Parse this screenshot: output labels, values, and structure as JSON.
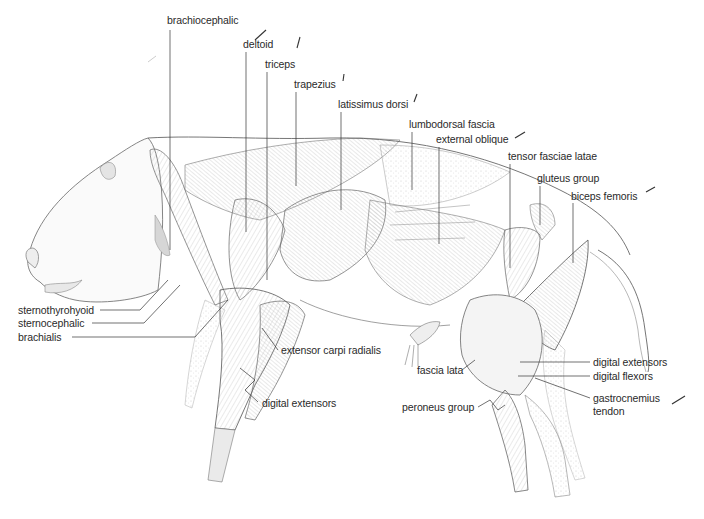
{
  "figure": {
    "colors": {
      "ink": "#2a2a2a",
      "shade": "#9a9a9a",
      "background": "#ffffff"
    }
  },
  "labels": {
    "top": [
      {
        "id": "brachiocephalic",
        "text": "brachiocephalic",
        "x": 167,
        "y": 14,
        "lx": 170,
        "ly1": 30,
        "ly2": 250
      },
      {
        "id": "deltoid",
        "text": "deltoid",
        "x": 243,
        "y": 38,
        "lx": 246,
        "ly1": 52,
        "ly2": 232
      },
      {
        "id": "triceps",
        "text": "triceps",
        "x": 265,
        "y": 58,
        "lx": 267,
        "ly1": 72,
        "ly2": 280
      },
      {
        "id": "trapezius",
        "text": "trapezius",
        "x": 294,
        "y": 78,
        "lx": 296,
        "ly1": 92,
        "ly2": 186
      },
      {
        "id": "latissimus-dorsi",
        "text": "latissimus dorsi",
        "x": 338,
        "y": 98,
        "lx": 341,
        "ly1": 112,
        "ly2": 210
      },
      {
        "id": "lumbodorsal-fascia",
        "text": "lumbodorsal fascia",
        "x": 409,
        "y": 118,
        "lx": 412,
        "ly1": 132,
        "ly2": 190
      },
      {
        "id": "external-oblique",
        "text": "external oblique",
        "x": 436,
        "y": 133,
        "lx": 439,
        "ly1": 147,
        "ly2": 244
      },
      {
        "id": "tensor-fasciae-latae",
        "text": "tensor fasciae latae",
        "x": 508,
        "y": 150,
        "lx": 510,
        "ly1": 164,
        "ly2": 268
      },
      {
        "id": "gluteus-group",
        "text": "gluteus group",
        "x": 537,
        "y": 172,
        "lx": 540,
        "ly1": 186,
        "ly2": 225
      },
      {
        "id": "biceps-femoris",
        "text": "biceps femoris",
        "x": 571,
        "y": 190,
        "lx": 573,
        "ly1": 203,
        "ly2": 263
      }
    ],
    "left": [
      {
        "id": "sternothyrohyoid",
        "text": "sternothyrohyoid",
        "x": 18,
        "y": 307
      },
      {
        "id": "sternocephalic",
        "text": "sternocephalic",
        "x": 18,
        "y": 320
      },
      {
        "id": "brachialis",
        "text": "brachialis",
        "x": 18,
        "y": 333
      }
    ],
    "forelimb": [
      {
        "id": "extensor-carpi-radialis",
        "text": "extensor carpi radialis",
        "x": 281,
        "y": 345
      },
      {
        "id": "digital-extensors-fore",
        "text": "digital extensors",
        "x": 262,
        "y": 398
      }
    ],
    "hindlimb": [
      {
        "id": "fascia-lata",
        "text": "fascia lata",
        "x": 417,
        "y": 366
      },
      {
        "id": "peroneus-group",
        "text": "peroneus group",
        "x": 402,
        "y": 402
      },
      {
        "id": "digital-extensors-hind",
        "text": "digital extensors",
        "x": 593,
        "y": 357
      },
      {
        "id": "digital-flexors",
        "text": "digital flexors",
        "x": 593,
        "y": 372
      },
      {
        "id": "gastrocnemius-tendon-1",
        "text": "gastrocnemius",
        "x": 593,
        "y": 397
      },
      {
        "id": "gastrocnemius-tendon-2",
        "text": "tendon",
        "x": 593,
        "y": 410
      }
    ]
  }
}
